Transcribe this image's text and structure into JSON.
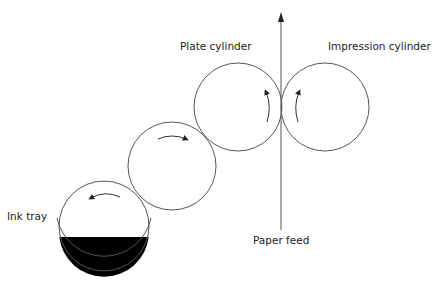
{
  "diagram": {
    "labels": {
      "plate_cylinder": "Plate cylinder",
      "impression_cylinder": "Impression cylinder",
      "paper_feed": "Paper feed",
      "ink_tray": "Ink tray"
    },
    "components": [
      {
        "id": "ink-roller",
        "cx": 104,
        "cy": 226,
        "r": 45,
        "rotation": "counterclockwise"
      },
      {
        "id": "transfer-roller",
        "cx": 172,
        "cy": 166,
        "r": 44,
        "rotation": "clockwise"
      },
      {
        "id": "plate-cylinder",
        "cx": 238,
        "cy": 107,
        "r": 44,
        "rotation": "counterclockwise"
      },
      {
        "id": "impression-cylinder",
        "cx": 325,
        "cy": 107,
        "r": 44,
        "rotation": "clockwise"
      }
    ],
    "paper_feed_direction": "up",
    "colors": {
      "stroke": "#555555",
      "ink": "#000000",
      "background": "#ffffff"
    }
  }
}
